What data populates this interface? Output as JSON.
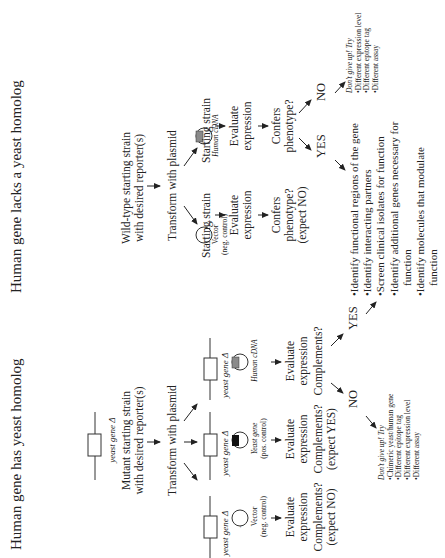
{
  "left_panel": {
    "title": "Human gene has yeast homolog",
    "gene_label": "yeast gene Δ",
    "start_line1": "Mutant starting strain",
    "start_line2": "with desired reporter(s)",
    "transform": "Transform with plasmid",
    "columns": [
      {
        "gene_label": "yeast gene Δ",
        "plasmid_l1": "Vector",
        "plasmid_l2": "(neg. control)",
        "evaluate_l1": "Evaluate",
        "evaluate_l2": "expression",
        "question_l1": "Complements?",
        "question_l2": "(expect NO)",
        "insert": "none"
      },
      {
        "gene_label": "yeast gene Δ",
        "plasmid_l1": "Yeast gene",
        "plasmid_l2": "(pos. control)",
        "evaluate_l1": "Evaluate",
        "evaluate_l2": "expression",
        "question_l1": "Complements?",
        "question_l2": "(expect YES)",
        "insert": "black"
      },
      {
        "gene_label": "yeast gene Δ",
        "plasmid_l1": "Human cDNA",
        "plasmid_l2": "",
        "evaluate_l1": "Evaluate",
        "evaluate_l2": "expression",
        "question_l1": "Complements?",
        "question_l2": "",
        "insert": "gray"
      }
    ],
    "no_label": "NO",
    "yes_label": "YES",
    "no_box": {
      "heading": "Don't give up! Try",
      "items": [
        "Chimeric yeast/human gene",
        "Different epitope tag",
        "Different expression level",
        "Different assay"
      ]
    }
  },
  "right_panel": {
    "title": "Human gene lacks a yeast homolog",
    "start_line1": "Wild-type starting strain",
    "start_line2": "with desired reporter(s)",
    "transform": "Transform with plasmid",
    "columns": [
      {
        "strain": "Starting strain",
        "plasmid_l1": "Vector",
        "plasmid_l2": "(neg. control)",
        "evaluate_l1": "Evaluate",
        "evaluate_l2": "expression",
        "question_l1": "Confers",
        "question_l2": "phenotype?",
        "question_l3": "(expect NO)",
        "insert": "none"
      },
      {
        "strain": "Starting strain",
        "plasmid_l1": "Human cDNA",
        "plasmid_l2": "",
        "evaluate_l1": "Evaluate",
        "evaluate_l2": "expression",
        "question_l1": "Confers",
        "question_l2": "phenotype?",
        "question_l3": "",
        "insert": "gray"
      }
    ],
    "yes_label": "YES",
    "no_label": "NO",
    "no_box": {
      "heading": "Don't give up! Try",
      "items": [
        "Different expression level",
        "Different epitope tag",
        "Different assay"
      ]
    }
  },
  "yes_results": [
    "Identify functional regions of the gene",
    "Identify interacting partners",
    "Screen clinical isolates for function",
    "Identify additional genes necessary for",
    "function",
    "Identify molecules that modulate",
    "function"
  ],
  "colors": {
    "text": "#222222",
    "gray_insert": "#8a8a8a",
    "black_insert": "#111111"
  }
}
